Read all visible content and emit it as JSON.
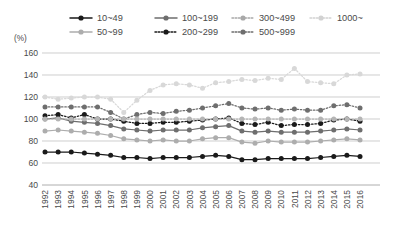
{
  "chart_data": {
    "type": "line",
    "title": "",
    "subtitle": "",
    "xlabel": "",
    "ylabel": "(%)",
    "unit_label": "(%)",
    "grid": true,
    "legend_position": "top",
    "ylim": [
      40,
      160
    ],
    "yticks": [
      40,
      60,
      80,
      100,
      120,
      140,
      160
    ],
    "categories": [
      "1992",
      "1993",
      "1994",
      "1995",
      "1996",
      "1997",
      "1998",
      "1999",
      "2000",
      "2001",
      "2002",
      "2003",
      "2004",
      "2005",
      "2006",
      "2007",
      "2008",
      "2009",
      "2010",
      "2011",
      "2012",
      "2013",
      "2014",
      "2015",
      "2016"
    ],
    "x": [
      1992,
      1993,
      1994,
      1995,
      1996,
      1997,
      1998,
      1999,
      2000,
      2001,
      2002,
      2003,
      2004,
      2005,
      2006,
      2007,
      2008,
      2009,
      2010,
      2011,
      2012,
      2013,
      2014,
      2015,
      2016
    ],
    "series": [
      {
        "name": "10~49",
        "color": "#1a1a1a",
        "line_style": "solid",
        "marker": "circle",
        "values": [
          70,
          70,
          70,
          69,
          68,
          67,
          65,
          65,
          64,
          65,
          65,
          65,
          66,
          67,
          66,
          63,
          63,
          64,
          64,
          64,
          64,
          65,
          66,
          67,
          66
        ]
      },
      {
        "name": "50~99",
        "color": "#adadad",
        "line_style": "solid",
        "marker": "circle",
        "values": [
          89,
          90,
          89,
          88,
          87,
          85,
          82,
          81,
          80,
          81,
          80,
          80,
          82,
          83,
          83,
          79,
          78,
          80,
          79,
          79,
          79,
          80,
          81,
          82,
          81
        ]
      },
      {
        "name": "100~199",
        "color": "#6e6e6e",
        "line_style": "solid",
        "marker": "circle",
        "values": [
          100,
          101,
          98,
          97,
          96,
          94,
          91,
          90,
          89,
          90,
          90,
          90,
          92,
          93,
          94,
          89,
          88,
          89,
          88,
          88,
          88,
          89,
          90,
          91,
          90
        ]
      },
      {
        "name": "200~299",
        "color": "#1a1a1a",
        "line_style": "dotted",
        "marker": "circle",
        "values": [
          103,
          104,
          101,
          104,
          100,
          100,
          98,
          96,
          96,
          97,
          97,
          98,
          99,
          100,
          101,
          96,
          95,
          97,
          94,
          95,
          95,
          96,
          99,
          100,
          98
        ]
      },
      {
        "name": "300~499",
        "color": "#6e6e6e",
        "line_style": "dotted",
        "marker": "circle",
        "values": [
          111,
          111,
          111,
          111,
          111,
          106,
          100,
          104,
          106,
          105,
          107,
          108,
          110,
          112,
          114,
          110,
          109,
          110,
          108,
          109,
          108,
          108,
          112,
          113,
          110
        ]
      },
      {
        "name": "500~999",
        "color": "#b5b5b5",
        "line_style": "dotted",
        "marker": "circle",
        "values": [
          100,
          100,
          100,
          100,
          100,
          100,
          100,
          100,
          100,
          100,
          100,
          100,
          100,
          100,
          100,
          100,
          100,
          100,
          100,
          100,
          100,
          100,
          100,
          100,
          100
        ]
      },
      {
        "name": "1000~",
        "color": "#d8d8d8",
        "line_style": "dotted",
        "marker": "circle",
        "values": [
          120,
          118,
          119,
          120,
          120,
          118,
          106,
          117,
          126,
          131,
          132,
          131,
          128,
          133,
          134,
          136,
          135,
          137,
          136,
          146,
          134,
          133,
          132,
          140,
          141
        ]
      }
    ],
    "legend": [
      {
        "label": "10~49",
        "color": "#1a1a1a",
        "line_style": "solid",
        "row": 0,
        "col": 0
      },
      {
        "label": "100~199",
        "color": "#6e6e6e",
        "line_style": "solid",
        "row": 0,
        "col": 1
      },
      {
        "label": "300~499",
        "color": "#a8a8a8",
        "line_style": "dotted",
        "row": 0,
        "col": 2
      },
      {
        "label": "1000~",
        "color": "#d2d2d2",
        "line_style": "dotted",
        "row": 0,
        "col": 3
      },
      {
        "label": "50~99",
        "color": "#adadad",
        "line_style": "solid",
        "row": 1,
        "col": 0
      },
      {
        "label": "200~299",
        "color": "#1a1a1a",
        "line_style": "dotted",
        "row": 1,
        "col": 1
      },
      {
        "label": "500~999",
        "color": "#6e6e6e",
        "line_style": "dotted",
        "row": 1,
        "col": 2
      }
    ]
  }
}
